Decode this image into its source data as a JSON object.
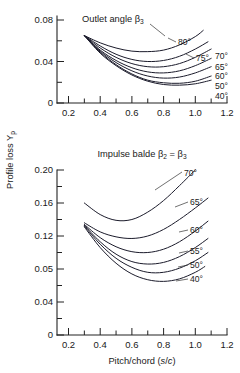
{
  "figure": {
    "y_axis_title": "Profile loss Y",
    "y_axis_title_sub": "p",
    "x_axis_title_main": "Pitch/chord (",
    "x_axis_title_italic_s": "s",
    "x_axis_title_slash": "/",
    "x_axis_title_italic_c": "c",
    "x_axis_title_end": ")"
  },
  "chart_data": [
    {
      "type": "line",
      "id": "top-chart",
      "title": "Outlet angle β",
      "title_sub": "3",
      "xlabel": "Pitch/chord (s/c)",
      "ylabel": "Profile loss Yp",
      "xlim": [
        0.15,
        1.2
      ],
      "ylim": [
        0.0,
        0.1
      ],
      "grid": false,
      "legend": "inline-right-labels",
      "xticks": [
        0.2,
        0.4,
        0.6,
        0.8,
        1.0,
        1.2
      ],
      "xticklabels": [
        "0.2",
        "0.4",
        "0.6",
        "0.8",
        "1.0",
        "1.2"
      ],
      "yticks": [
        0,
        0.04,
        0.08
      ],
      "yticklabels": [
        "0",
        "0.04",
        "0.08"
      ],
      "yminorticks": [
        0.02,
        0.06,
        0.1
      ],
      "series": [
        {
          "name": "80°",
          "label": "80°",
          "x": [
            0.3,
            0.4,
            0.5,
            0.6,
            0.7,
            0.8,
            0.9,
            1.0,
            1.05
          ],
          "y": [
            0.065,
            0.058,
            0.053,
            0.05,
            0.0495,
            0.051,
            0.056,
            0.064,
            0.07
          ]
        },
        {
          "name": "75°",
          "label": "75°",
          "x": [
            0.3,
            0.4,
            0.5,
            0.6,
            0.7,
            0.8,
            0.9,
            1.0,
            1.08
          ],
          "y": [
            0.065,
            0.055,
            0.047,
            0.042,
            0.04,
            0.041,
            0.045,
            0.052,
            0.059
          ]
        },
        {
          "name": "70°",
          "label": "70°",
          "x": [
            0.3,
            0.4,
            0.5,
            0.6,
            0.7,
            0.8,
            0.9,
            1.0,
            1.1
          ],
          "y": [
            0.065,
            0.053,
            0.044,
            0.038,
            0.035,
            0.035,
            0.038,
            0.044,
            0.052
          ]
        },
        {
          "name": "65°",
          "label": "65°",
          "x": [
            0.3,
            0.4,
            0.5,
            0.6,
            0.7,
            0.8,
            0.9,
            1.0,
            1.1
          ],
          "y": [
            0.065,
            0.051,
            0.041,
            0.034,
            0.03,
            0.029,
            0.031,
            0.036,
            0.043
          ]
        },
        {
          "name": "60°",
          "label": "60°",
          "x": [
            0.3,
            0.4,
            0.5,
            0.6,
            0.7,
            0.8,
            0.9,
            1.0,
            1.1
          ],
          "y": [
            0.065,
            0.05,
            0.039,
            0.031,
            0.026,
            0.024,
            0.025,
            0.029,
            0.035
          ]
        },
        {
          "name": "50°",
          "label": "50°",
          "x": [
            0.3,
            0.4,
            0.5,
            0.6,
            0.7,
            0.8,
            0.9,
            1.0,
            1.1
          ],
          "y": [
            0.065,
            0.049,
            0.037,
            0.028,
            0.022,
            0.0195,
            0.019,
            0.021,
            0.026
          ]
        },
        {
          "name": "40°",
          "label": "40°",
          "x": [
            0.3,
            0.4,
            0.5,
            0.6,
            0.7,
            0.8,
            0.9,
            1.0,
            1.1
          ],
          "y": [
            0.065,
            0.048,
            0.036,
            0.027,
            0.021,
            0.0178,
            0.0172,
            0.0185,
            0.022
          ]
        }
      ]
    },
    {
      "type": "line",
      "id": "bottom-chart",
      "title": "Impulse balde β",
      "title_sub2": "2",
      "title_eq": " = β",
      "title_sub3": "3",
      "xlabel": "Pitch/chord (s/c)",
      "ylabel": "Profile loss Yp",
      "xlim": [
        0.15,
        1.2
      ],
      "ylim": [
        0.0,
        0.21
      ],
      "grid": false,
      "legend": "inline-right-labels",
      "xticks": [
        0.2,
        0.4,
        0.6,
        0.8,
        1.0,
        1.2
      ],
      "xticklabels": [
        "0.2",
        "0.4",
        "0.6",
        "0.8",
        "1.0",
        "1.2"
      ],
      "yticks": [
        0,
        0.04,
        0.05,
        0.12,
        0.16,
        0.2
      ],
      "yticklabels": [
        "0",
        "0.04",
        "0.05",
        "0.12",
        "0.16",
        "0.20"
      ],
      "ytickpositions_axisfraction": [
        0.0,
        0.2,
        0.4,
        0.6,
        0.8,
        1.0
      ],
      "yminorticks_axisfraction": [
        0.1,
        0.3,
        0.5,
        0.7,
        0.9
      ],
      "series": [
        {
          "name": "70°",
          "label": "70°",
          "x": [
            0.3,
            0.4,
            0.5,
            0.6,
            0.7,
            0.8,
            0.9,
            1.0
          ],
          "y": [
            0.16,
            0.146,
            0.139,
            0.14,
            0.149,
            0.163,
            0.181,
            0.2
          ]
        },
        {
          "name": "65°",
          "label": "65°",
          "x": [
            0.3,
            0.4,
            0.5,
            0.6,
            0.7,
            0.8,
            0.9,
            1.0,
            1.08
          ],
          "y": [
            0.136,
            0.125,
            0.119,
            0.117,
            0.12,
            0.128,
            0.14,
            0.154,
            0.166
          ]
        },
        {
          "name": "60°",
          "label": "60°",
          "x": [
            0.3,
            0.4,
            0.5,
            0.6,
            0.7,
            0.8,
            0.9,
            1.0,
            1.08
          ],
          "y": [
            0.134,
            0.118,
            0.107,
            0.101,
            0.1,
            0.104,
            0.113,
            0.126,
            0.138
          ]
        },
        {
          "name": "55°",
          "label": "55°",
          "x": [
            0.3,
            0.4,
            0.5,
            0.6,
            0.7,
            0.8,
            0.9,
            1.0,
            1.08
          ],
          "y": [
            0.133,
            0.113,
            0.098,
            0.089,
            0.086,
            0.088,
            0.095,
            0.106,
            0.117
          ]
        },
        {
          "name": "50°",
          "label": "50°",
          "x": [
            0.3,
            0.4,
            0.5,
            0.6,
            0.7,
            0.8,
            0.9,
            1.0,
            1.08
          ],
          "y": [
            0.132,
            0.11,
            0.093,
            0.082,
            0.076,
            0.076,
            0.081,
            0.09,
            0.1
          ]
        },
        {
          "name": "40°",
          "label": "40°",
          "x": [
            0.3,
            0.4,
            0.5,
            0.6,
            0.7,
            0.8,
            0.9,
            1.0,
            1.06
          ],
          "y": [
            0.131,
            0.106,
            0.087,
            0.074,
            0.067,
            0.065,
            0.068,
            0.076,
            0.083
          ]
        }
      ]
    }
  ]
}
